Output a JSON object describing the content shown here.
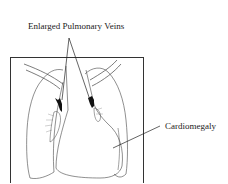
{
  "diagram": {
    "labels": {
      "top": "Enlarged Pulmonary Veins",
      "right": "Cardiomegaly"
    },
    "colors": {
      "line": "#333333",
      "frame": "#333333",
      "background": "#ffffff"
    }
  }
}
